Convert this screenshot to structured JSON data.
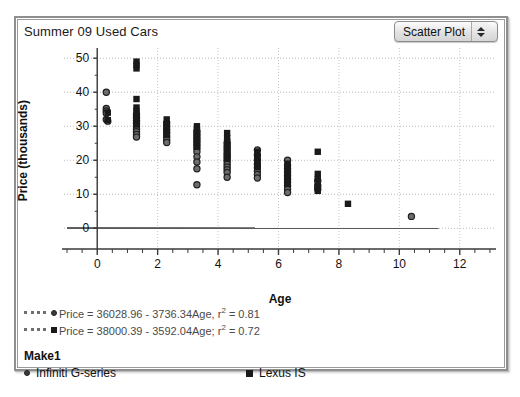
{
  "window": {
    "title": "Summer 09 Used Cars"
  },
  "plot_type_selector": {
    "value": "Scatter Plot",
    "up_arrow_icon": "triangle-up-icon",
    "down_arrow_icon": "triangle-down-icon"
  },
  "legend": {
    "equations": [
      {
        "marker": "circle",
        "text": "Price = 36028.96 - 3736.34Age, r",
        "sup": "2",
        "tail": " = 0.81"
      },
      {
        "marker": "square",
        "text": "Price = 38000.39 - 3592.04Age; r",
        "sup": "2",
        "tail": " = 0.72"
      }
    ],
    "group_title": "Make1",
    "keys": [
      {
        "marker": "circle",
        "label": "Infiniti G-series"
      },
      {
        "marker": "square",
        "label": "Lexus IS"
      }
    ]
  },
  "chart_data": {
    "type": "scatter",
    "title": "Summer 09 Used Cars",
    "xlabel": "Age",
    "ylabel": "Price (thousands)",
    "xlim": [
      -1.1,
      13.2
    ],
    "ylim": [
      -5.5,
      53
    ],
    "xticks": [
      0,
      2,
      4,
      6,
      8,
      10,
      12
    ],
    "yticks": [
      0,
      10,
      20,
      30,
      40,
      50
    ],
    "grid": true,
    "legend_position": "below-plot",
    "series": [
      {
        "name": "Infiniti G-series",
        "marker": "circle",
        "color": "#3a3a3a",
        "points": [
          [
            0.3,
            40.0
          ],
          [
            0.3,
            35.2
          ],
          [
            0.3,
            34.5
          ],
          [
            0.3,
            33.8
          ],
          [
            0.3,
            32.0
          ],
          [
            0.35,
            31.5
          ],
          [
            1.3,
            33.4
          ],
          [
            1.3,
            32.5
          ],
          [
            1.3,
            31.6
          ],
          [
            1.3,
            30.8
          ],
          [
            1.3,
            30.0
          ],
          [
            1.3,
            29.2
          ],
          [
            1.3,
            28.4
          ],
          [
            1.3,
            27.6
          ],
          [
            1.3,
            26.8
          ],
          [
            2.3,
            31.0
          ],
          [
            2.3,
            30.0
          ],
          [
            2.3,
            29.0
          ],
          [
            2.3,
            28.0
          ],
          [
            2.3,
            27.0
          ],
          [
            2.3,
            26.0
          ],
          [
            2.3,
            25.2
          ],
          [
            3.3,
            28.5
          ],
          [
            3.3,
            27.5
          ],
          [
            3.3,
            26.5
          ],
          [
            3.3,
            25.5
          ],
          [
            3.3,
            24.5
          ],
          [
            3.3,
            23.5
          ],
          [
            3.3,
            22.5
          ],
          [
            3.3,
            21.0
          ],
          [
            3.3,
            19.5
          ],
          [
            3.3,
            17.5
          ],
          [
            3.3,
            12.8
          ],
          [
            4.3,
            25.0
          ],
          [
            4.3,
            24.0
          ],
          [
            4.3,
            23.0
          ],
          [
            4.3,
            22.0
          ],
          [
            4.3,
            21.2
          ],
          [
            4.3,
            20.4
          ],
          [
            4.3,
            19.6
          ],
          [
            4.3,
            18.8
          ],
          [
            4.3,
            18.0
          ],
          [
            4.3,
            17.2
          ],
          [
            4.3,
            16.4
          ],
          [
            4.3,
            15.0
          ],
          [
            5.3,
            23.0
          ],
          [
            5.3,
            21.5
          ],
          [
            5.3,
            20.0
          ],
          [
            5.3,
            18.8
          ],
          [
            5.3,
            17.8
          ],
          [
            5.3,
            16.8
          ],
          [
            5.3,
            15.8
          ],
          [
            5.3,
            14.8
          ],
          [
            6.3,
            20.0
          ],
          [
            6.3,
            18.5
          ],
          [
            6.3,
            17.5
          ],
          [
            6.3,
            16.5
          ],
          [
            6.3,
            15.5
          ],
          [
            6.3,
            14.5
          ],
          [
            6.3,
            13.5
          ],
          [
            6.3,
            12.5
          ],
          [
            6.3,
            11.5
          ],
          [
            6.3,
            10.5
          ],
          [
            7.3,
            14.0
          ],
          [
            7.3,
            12.5
          ],
          [
            7.3,
            11.5
          ],
          [
            10.4,
            3.5
          ]
        ]
      },
      {
        "name": "Lexus IS",
        "marker": "square",
        "color": "#1a1a1a",
        "points": [
          [
            1.3,
            49.0
          ],
          [
            1.3,
            48.0
          ],
          [
            1.3,
            47.0
          ],
          [
            0.35,
            34.0
          ],
          [
            0.35,
            31.8
          ],
          [
            1.3,
            38.0
          ],
          [
            1.3,
            35.5
          ],
          [
            1.3,
            34.5
          ],
          [
            1.3,
            33.5
          ],
          [
            1.3,
            32.5
          ],
          [
            1.3,
            31.5
          ],
          [
            1.3,
            30.5
          ],
          [
            2.3,
            32.0
          ],
          [
            2.3,
            30.5
          ],
          [
            2.3,
            29.5
          ],
          [
            2.3,
            28.5
          ],
          [
            2.3,
            27.5
          ],
          [
            3.3,
            30.0
          ],
          [
            3.3,
            29.0
          ],
          [
            3.3,
            28.0
          ],
          [
            3.3,
            27.0
          ],
          [
            3.3,
            26.0
          ],
          [
            3.3,
            25.0
          ],
          [
            3.3,
            24.0
          ],
          [
            4.3,
            28.0
          ],
          [
            4.3,
            26.5
          ],
          [
            4.3,
            25.5
          ],
          [
            4.3,
            24.5
          ],
          [
            4.3,
            23.5
          ],
          [
            4.3,
            22.5
          ],
          [
            4.3,
            21.5
          ],
          [
            4.3,
            20.5
          ],
          [
            5.3,
            22.5
          ],
          [
            5.3,
            21.0
          ],
          [
            5.3,
            20.0
          ],
          [
            5.3,
            19.0
          ],
          [
            5.3,
            18.0
          ],
          [
            6.3,
            19.0
          ],
          [
            6.3,
            18.0
          ],
          [
            6.3,
            17.0
          ],
          [
            6.3,
            16.0
          ],
          [
            6.3,
            15.0
          ],
          [
            6.3,
            14.0
          ],
          [
            6.3,
            13.0
          ],
          [
            7.3,
            22.5
          ],
          [
            7.3,
            16.0
          ],
          [
            7.3,
            14.5
          ],
          [
            7.3,
            12.5
          ],
          [
            7.3,
            11.0
          ],
          [
            8.3,
            7.2
          ]
        ]
      }
    ],
    "fit_lines": [
      {
        "name": "Infiniti G-series fit",
        "intercept": 36.02896,
        "slope": -3.73634,
        "r2": 0.81,
        "x_from": -1.0,
        "x_to": 11.3
      },
      {
        "name": "Lexus IS fit",
        "intercept": 38.00039,
        "slope": -3.59204,
        "r2": 0.72,
        "x_from": -1.0,
        "x_to": 10.6
      }
    ]
  }
}
